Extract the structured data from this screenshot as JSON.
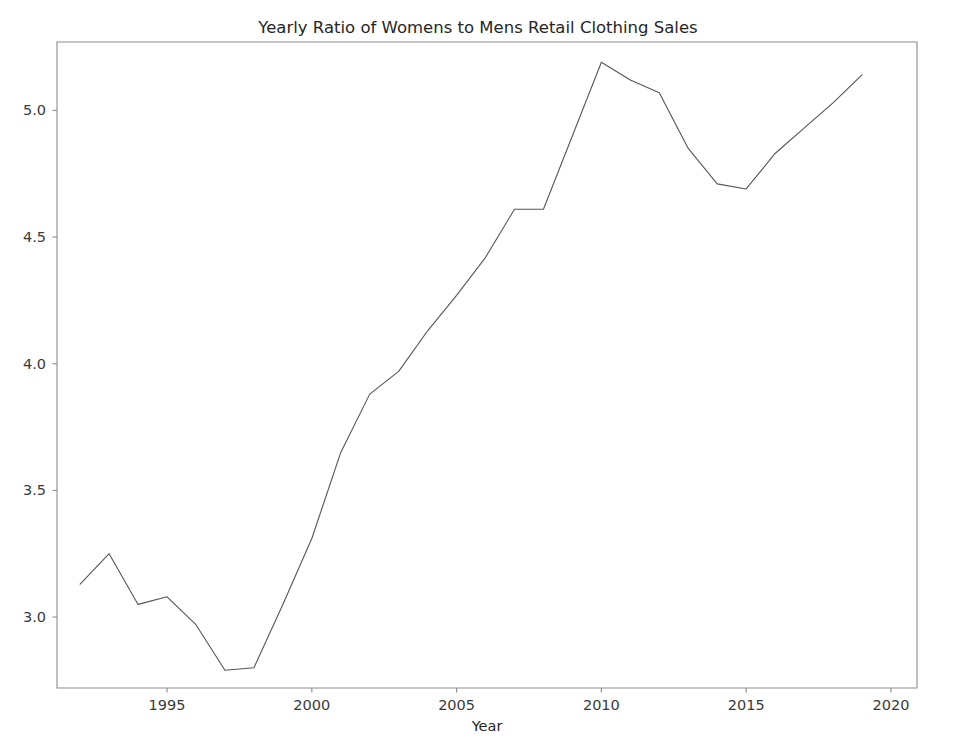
{
  "figure": {
    "background_color": "#ffffff",
    "width": 956,
    "height": 756
  },
  "chart_data": {
    "type": "line",
    "title": "Yearly Ratio of Womens to Mens Retail Clothing Sales",
    "xlabel": "Year",
    "ylabel": "",
    "xlim": [
      1991.2,
      2020.9
    ],
    "ylim": [
      2.72,
      5.27
    ],
    "grid": false,
    "legend": null,
    "line_color": "#55555a",
    "line_width": 1.1,
    "xticks": [
      1995,
      2000,
      2005,
      2010,
      2015,
      2020
    ],
    "xtick_labels": [
      "1995",
      "2000",
      "2005",
      "2010",
      "2015",
      "2020"
    ],
    "yticks": [
      3.0,
      3.5,
      4.0,
      4.5,
      5.0
    ],
    "ytick_labels": [
      "3.0",
      "3.5",
      "4.0",
      "4.5",
      "5.0"
    ],
    "x": [
      1992,
      1993,
      1994,
      1995,
      1996,
      1997,
      1998,
      1999,
      2000,
      2001,
      2002,
      2003,
      2004,
      2005,
      2006,
      2007,
      2008,
      2009,
      2010,
      2011,
      2012,
      2013,
      2014,
      2015,
      2016,
      2017,
      2018,
      2019
    ],
    "values": [
      3.13,
      3.25,
      3.05,
      3.08,
      2.97,
      2.79,
      2.8,
      3.05,
      3.31,
      3.65,
      3.88,
      3.97,
      4.13,
      4.27,
      4.42,
      4.61,
      4.61,
      4.9,
      5.19,
      5.12,
      5.07,
      4.85,
      4.71,
      4.69,
      4.83,
      4.93,
      5.03,
      5.14
    ],
    "series": [
      {
        "name": "Ratio of womens to mens retail clothing sales",
        "values": [
          3.13,
          3.25,
          3.05,
          3.08,
          2.97,
          2.79,
          2.8,
          3.05,
          3.31,
          3.65,
          3.88,
          3.97,
          4.13,
          4.27,
          4.42,
          4.61,
          4.61,
          4.9,
          5.19,
          5.12,
          5.07,
          4.85,
          4.71,
          4.69,
          4.83,
          4.93,
          5.03,
          5.14
        ]
      }
    ]
  }
}
